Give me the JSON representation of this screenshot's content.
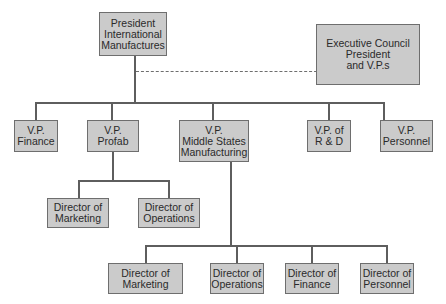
{
  "diagram": {
    "type": "org-chart",
    "nodes": {
      "president": "President\nInternational\nManufactures",
      "exec_council": "Executive Council\nPresident\nand V.P.s",
      "vp_finance": "V.P.\nFinance",
      "vp_profab": "V.P.\nProfab",
      "vp_msm": "V.P.\nMiddle States\nManufacturing",
      "vp_rd": "V.P. of\nR & D",
      "vp_personnel": "V.P.\nPersonnel",
      "profab_dir_marketing": "Director of\nMarketing",
      "profab_dir_operations": "Director of\nOperations",
      "msm_dir_marketing": "Director of\nMarketing",
      "msm_dir_operations": "Director of\nOperations",
      "msm_dir_finance": "Director of\nFinance",
      "msm_dir_personnel": "Director of\nPersonnel"
    },
    "edges": [
      {
        "from": "president",
        "to": "exec_council",
        "style": "dashed"
      },
      {
        "from": "president",
        "to": "vp_finance",
        "style": "solid"
      },
      {
        "from": "president",
        "to": "vp_profab",
        "style": "solid"
      },
      {
        "from": "president",
        "to": "vp_msm",
        "style": "solid"
      },
      {
        "from": "president",
        "to": "vp_rd",
        "style": "solid"
      },
      {
        "from": "president",
        "to": "vp_personnel",
        "style": "solid"
      },
      {
        "from": "vp_profab",
        "to": "profab_dir_marketing",
        "style": "solid"
      },
      {
        "from": "vp_profab",
        "to": "profab_dir_operations",
        "style": "solid"
      },
      {
        "from": "vp_msm",
        "to": "msm_dir_marketing",
        "style": "solid"
      },
      {
        "from": "vp_msm",
        "to": "msm_dir_operations",
        "style": "solid"
      },
      {
        "from": "vp_msm",
        "to": "msm_dir_finance",
        "style": "solid"
      },
      {
        "from": "vp_msm",
        "to": "msm_dir_personnel",
        "style": "solid"
      }
    ]
  }
}
